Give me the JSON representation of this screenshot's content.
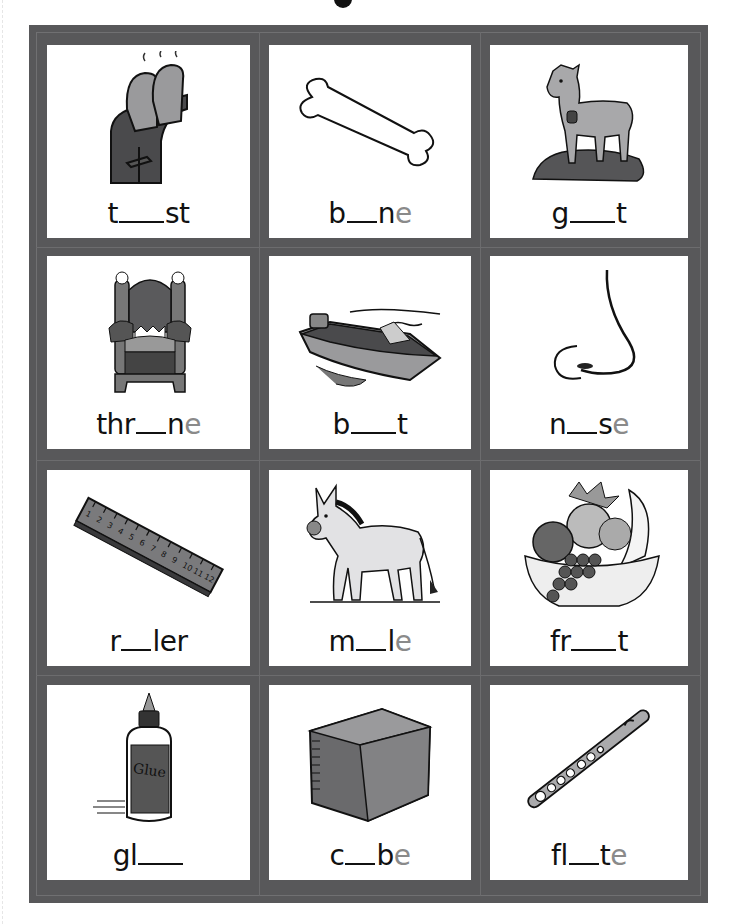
{
  "worksheet": {
    "title_fragment": "•",
    "colors": {
      "frame": "#58585a",
      "card": "#ffffff",
      "text": "#111111",
      "silent_e": "#8a8a8a"
    },
    "cards": [
      {
        "word": "toast",
        "picture": "toaster-icon",
        "before": "t",
        "blank_chars": 3,
        "after": "st",
        "silent": ""
      },
      {
        "word": "bone",
        "picture": "bone-icon",
        "before": "b",
        "blank_chars": 2,
        "after": "n",
        "silent": "e"
      },
      {
        "word": "goat",
        "picture": "goat-icon",
        "before": "g",
        "blank_chars": 3,
        "after": "t",
        "silent": ""
      },
      {
        "word": "throne",
        "picture": "throne-icon",
        "before": "thr",
        "blank_chars": 2,
        "after": "n",
        "silent": "e"
      },
      {
        "word": "boat",
        "picture": "boat-icon",
        "before": "b",
        "blank_chars": 3,
        "after": "t",
        "silent": ""
      },
      {
        "word": "nose",
        "picture": "nose-icon",
        "before": "n",
        "blank_chars": 2,
        "after": "s",
        "silent": "e"
      },
      {
        "word": "ruler",
        "picture": "ruler-icon",
        "before": "r",
        "blank_chars": 2,
        "after": "ler",
        "silent": ""
      },
      {
        "word": "mule",
        "picture": "mule-icon",
        "before": "m",
        "blank_chars": 2,
        "after": "l",
        "silent": "e"
      },
      {
        "word": "fruit",
        "picture": "fruit-basket-icon",
        "before": "fr",
        "blank_chars": 3,
        "after": "t",
        "silent": ""
      },
      {
        "word": "glue",
        "picture": "glue-bottle-icon",
        "before": "gl",
        "blank_chars": 3,
        "after": "",
        "silent": ""
      },
      {
        "word": "cube",
        "picture": "cube-icon",
        "before": "c",
        "blank_chars": 2,
        "after": "b",
        "silent": "e"
      },
      {
        "word": "flute",
        "picture": "flute-icon",
        "before": "fl",
        "blank_chars": 2,
        "after": "t",
        "silent": "e"
      }
    ],
    "ruler_numbers": [
      "1",
      "2",
      "3",
      "4",
      "5",
      "6",
      "7",
      "8",
      "9",
      "10",
      "11",
      "12"
    ],
    "glue_label": "Glue"
  }
}
